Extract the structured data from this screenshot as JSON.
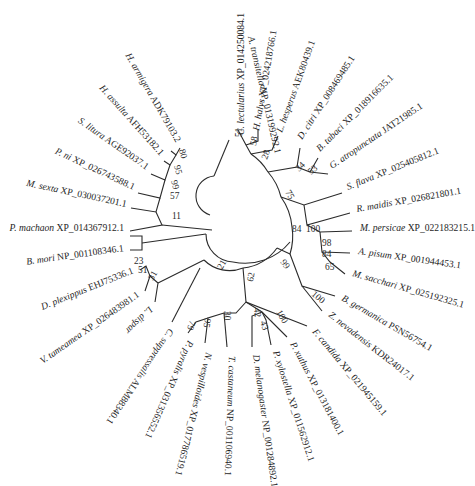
{
  "figure": {
    "type": "circular-phylogenetic-tree",
    "center": [
      232,
      232
    ],
    "line_color": "#2b2b2b",
    "text_color": "#1e1e1e"
  },
  "taxa": [
    {
      "id": "t1",
      "species": "A. transitella",
      "accession": "XP_013199292.1",
      "label_x": 248,
      "label_y": 37,
      "angle": 77,
      "tip": [
        229,
        140
      ]
    },
    {
      "id": "t2",
      "species": "C. lectularius",
      "accession": "XP_014250084.1",
      "label_x": 244,
      "label_y": 135,
      "angle": -90,
      "tip": [
        238,
        130
      ]
    },
    {
      "id": "t3",
      "species": "H. halys",
      "accession": "XP_024218766.1",
      "label_x": 259,
      "label_y": 131,
      "angle": -80,
      "tip": [
        258,
        130
      ]
    },
    {
      "id": "t4",
      "species": "L. hesperus",
      "accession": "AEK80439.1",
      "label_x": 282,
      "label_y": 133,
      "angle": -70,
      "tip": [
        278,
        136
      ]
    },
    {
      "id": "t5",
      "species": "D. citri",
      "accession": "XP_008469485.1",
      "label_x": 302,
      "label_y": 140,
      "angle": -57,
      "tip": [
        300,
        148
      ]
    },
    {
      "id": "t6",
      "species": "B. tabaci",
      "accession": "XP_018916635.1",
      "label_x": 320,
      "label_y": 152,
      "angle": -45,
      "tip": [
        318,
        158
      ]
    },
    {
      "id": "t7",
      "species": "G. atropunctata",
      "accession": "JAT21985.1",
      "label_x": 332,
      "label_y": 169,
      "angle": -34,
      "tip": [
        328,
        174
      ]
    },
    {
      "id": "t8",
      "species": "S. flava",
      "accession": "XP_025405812.1",
      "label_x": 348,
      "label_y": 190,
      "angle": -22,
      "tip": [
        342,
        193
      ]
    },
    {
      "id": "t9",
      "species": "R. maidis",
      "accession": "XP_026821801.1",
      "label_x": 357,
      "label_y": 212,
      "angle": -10,
      "tip": [
        350,
        213
      ]
    },
    {
      "id": "t10",
      "species": "M. persicae",
      "accession": "XP_022183215.1",
      "label_x": 360,
      "label_y": 231,
      "angle": 0,
      "tip": [
        352,
        231
      ]
    },
    {
      "id": "t11",
      "species": "A. pisum",
      "accession": "XP_001944453.1",
      "label_x": 358,
      "label_y": 254,
      "angle": 8,
      "tip": [
        350,
        253
      ]
    },
    {
      "id": "t12",
      "species": "M. sacchari",
      "accession": "XP_025192325.1",
      "label_x": 352,
      "label_y": 276,
      "angle": 16,
      "tip": [
        345,
        274
      ]
    },
    {
      "id": "t13",
      "species": "B. germanica",
      "accession": "PSN56754.1",
      "label_x": 341,
      "label_y": 300,
      "angle": 30,
      "tip": [
        335,
        296
      ]
    },
    {
      "id": "t14",
      "species": "Z. nevadensis",
      "accession": "KDR24017.1",
      "label_x": 328,
      "label_y": 316,
      "angle": 38,
      "tip": [
        322,
        311
      ]
    },
    {
      "id": "t15",
      "species": "F. candida",
      "accession": "XP_021945159.1",
      "label_x": 312,
      "label_y": 332,
      "angle": 50,
      "tip": [
        307,
        326
      ]
    },
    {
      "id": "t16",
      "species": "P. xuthus",
      "accession": "XP_013181400.1",
      "label_x": 290,
      "label_y": 344,
      "angle": 62,
      "tip": [
        287,
        337
      ]
    },
    {
      "id": "t17",
      "species": "P. xylostella",
      "accession": "XP_011562912.1",
      "label_x": 273,
      "label_y": 352,
      "angle": 72,
      "tip": [
        271,
        345
      ]
    },
    {
      "id": "t18",
      "species": "D. melanogaster",
      "accession": "NP_001284892.1",
      "label_x": 253,
      "label_y": 355,
      "angle": 82,
      "tip": [
        252,
        347
      ]
    },
    {
      "id": "t19",
      "species": "T. castaneum",
      "accession": "NP_001106940.1",
      "label_x": 229,
      "label_y": 356,
      "angle": 92,
      "tip": [
        227,
        347
      ]
    },
    {
      "id": "t20",
      "species": "N. vespilloides",
      "accession": "XP_017786519.1",
      "label_x": 206,
      "label_y": 352,
      "angle": 104,
      "tip": [
        205,
        343
      ]
    },
    {
      "id": "t21",
      "species": "P. pyralis",
      "accession": "XP_031356552.1",
      "label_x": 188,
      "label_y": 340,
      "angle": 114,
      "tip": [
        188,
        333
      ]
    },
    {
      "id": "t22",
      "species": "C. suppressalis",
      "accession": "ALM88340.1",
      "label_x": 169,
      "label_y": 328,
      "angle": 124,
      "tip": [
        172,
        322
      ]
    },
    {
      "id": "t23",
      "species": "L. dispar",
      "accession": "",
      "label_x": 149,
      "label_y": 306,
      "angle": 135,
      "tip": [
        155,
        302
      ]
    },
    {
      "id": "t24",
      "species": "V. tameamea",
      "accession": "XP_026483981.1",
      "label_x": 140,
      "label_y": 296,
      "angle": -35,
      "tip": [
        145,
        291
      ],
      "anchor": "end"
    },
    {
      "id": "t25",
      "species": "D. plexippus",
      "accession": "EHJ75336.1",
      "label_x": 134,
      "label_y": 273,
      "angle": -22,
      "tip": [
        140,
        270
      ],
      "anchor": "end"
    },
    {
      "id": "t26",
      "species": "B. mori",
      "accession": "NP_001108346.1",
      "label_x": 124,
      "label_y": 251,
      "angle": -8,
      "tip": [
        130,
        250
      ],
      "anchor": "end"
    },
    {
      "id": "t27",
      "species": "P. machaon",
      "accession": "XP_014367912.1",
      "label_x": 124,
      "label_y": 231,
      "angle": 0,
      "tip": [
        130,
        231
      ],
      "anchor": "end"
    },
    {
      "id": "t28",
      "species": "M. sexta",
      "accession": "XP_030037201.1",
      "label_x": 126,
      "label_y": 207,
      "angle": 12,
      "tip": [
        131,
        208
      ],
      "anchor": "end"
    },
    {
      "id": "t29",
      "species": "P. ni",
      "accession": "XP_026743588.1",
      "label_x": 133,
      "label_y": 190,
      "angle": 25,
      "tip": [
        138,
        193
      ],
      "anchor": "end"
    },
    {
      "id": "t30",
      "species": "S. litura",
      "accession": "AGE92037.1",
      "label_x": 146,
      "label_y": 170,
      "angle": 35,
      "tip": [
        151,
        174
      ],
      "anchor": "end"
    },
    {
      "id": "t31",
      "species": "H. assulta",
      "accession": "AFH53182.1",
      "label_x": 160,
      "label_y": 156,
      "angle": 48,
      "tip": [
        164,
        161
      ],
      "anchor": "end"
    },
    {
      "id": "t32",
      "species": "H. armigera",
      "accession": "ADK79103.2",
      "label_x": 176,
      "label_y": 143,
      "angle": 60,
      "tip": [
        180,
        148
      ],
      "anchor": "end"
    }
  ],
  "bootstrap": [
    {
      "value": "80",
      "x": 179,
      "y": 150,
      "angle": 75
    },
    {
      "value": "95",
      "x": 174,
      "y": 166,
      "angle": 75
    },
    {
      "value": "99",
      "x": 171,
      "y": 181,
      "angle": 75
    },
    {
      "value": "57",
      "x": 170,
      "y": 199,
      "angle": 0
    },
    {
      "value": "11",
      "x": 172,
      "y": 219,
      "angle": 0
    },
    {
      "value": "23",
      "x": 134,
      "y": 264,
      "angle": 0
    },
    {
      "value": "51",
      "x": 138,
      "y": 273,
      "angle": 0
    },
    {
      "value": "31",
      "x": 153,
      "y": 281,
      "angle": -60
    },
    {
      "value": "21",
      "x": 222,
      "y": 270,
      "angle": -60
    },
    {
      "value": "62",
      "x": 253,
      "y": 282,
      "angle": -80
    },
    {
      "value": "99",
      "x": 280,
      "y": 262,
      "angle": 55
    },
    {
      "value": "84",
      "x": 292,
      "y": 232,
      "angle": 0
    },
    {
      "value": "100",
      "x": 306,
      "y": 232,
      "angle": 0
    },
    {
      "value": "75",
      "x": 285,
      "y": 192,
      "angle": 60
    },
    {
      "value": "28",
      "x": 267,
      "y": 160,
      "angle": -70
    },
    {
      "value": "58",
      "x": 256,
      "y": 146,
      "angle": -80
    },
    {
      "value": "51",
      "x": 242,
      "y": 137,
      "angle": -90
    },
    {
      "value": "34",
      "x": 299,
      "y": 172,
      "angle": -45
    },
    {
      "value": "53",
      "x": 311,
      "y": 175,
      "angle": -40
    },
    {
      "value": "98",
      "x": 322,
      "y": 246,
      "angle": 0
    },
    {
      "value": "84",
      "x": 322,
      "y": 257,
      "angle": 0
    },
    {
      "value": "65",
      "x": 325,
      "y": 270,
      "angle": 0
    },
    {
      "value": "100",
      "x": 311,
      "y": 295,
      "angle": 40
    },
    {
      "value": "42",
      "x": 254,
      "y": 308,
      "angle": 85
    },
    {
      "value": "30",
      "x": 224,
      "y": 311,
      "angle": 90
    },
    {
      "value": "95",
      "x": 205,
      "y": 318,
      "angle": 100
    },
    {
      "value": "79",
      "x": 190,
      "y": 320,
      "angle": 110
    },
    {
      "value": "43",
      "x": 260,
      "y": 322,
      "angle": 70
    },
    {
      "value": "100",
      "x": 276,
      "y": 312,
      "angle": 60
    }
  ],
  "branches": [
    "M 229 140 L 214 176",
    "M 180 148 L 176 155 L 171 151",
    "M 164 161 L 170 165 L 176 155",
    "M 151 174 L 165 180 L 170 165",
    "M 138 193 L 160 198 L 165 180",
    "M 131 208 L 156 212 L 160 198",
    "M 130 231 L 162 225 L 156 212",
    "M 130 250 L 142 250 L 142 236 L 130 236",
    "M 142 243 L 206 234",
    "M 162 225 L 212 230",
    "M 140 270 L 146 266 L 150 276 L 145 291",
    "M 150 276 L 158 283 L 155 302",
    "M 158 283 L 204 260",
    "M 172 322 L 200 268",
    "M 214 176 A 20 20 0 0 0 210 215",
    "M 206 234 A 28 28 0 0 0 233 262",
    "M 204 260 A 36 36 0 0 0 243 268",
    "M 243 268 A 48 48 0 0 0 277 248",
    "M 233 262 A 58 58 0 0 0 290 242",
    "M 277 248 L 290 254 A 60 60 0 0 0 292 227",
    "M 292 227 A 60 60 0 0 0 281 197",
    "M 281 197 A 60 60 0 0 0 268 172",
    "M 268 172 A 56 56 0 0 0 251 154",
    "M 251 154 L 246 145 L 238 130",
    "M 246 145 L 258 141 L 258 130",
    "M 251 154 L 272 150 L 278 136",
    "M 268 172 L 297 167 L 300 148",
    "M 297 167 L 310 172 L 318 158",
    "M 310 172 L 328 174",
    "M 281 197 L 304 205 L 342 193",
    "M 304 205 L 307 225 L 350 213",
    "M 307 225 L 320 232 L 352 231",
    "M 320 232 L 322 252 L 350 253",
    "M 322 252 L 330 262 L 345 274",
    "M 290 254 L 302 286 L 335 296",
    "M 302 286 L 310 296 L 322 311",
    "M 243 268 L 246 302 L 307 326",
    "M 246 302 L 236 313 L 224 313",
    "M 246 302 L 262 312 L 287 337",
    "M 262 312 L 266 320 L 271 345",
    "M 262 312 L 252 316 L 252 347",
    "M 224 313 L 227 347",
    "M 224 313 L 208 318 L 205 343",
    "M 208 318 L 196 322 L 188 333"
  ]
}
